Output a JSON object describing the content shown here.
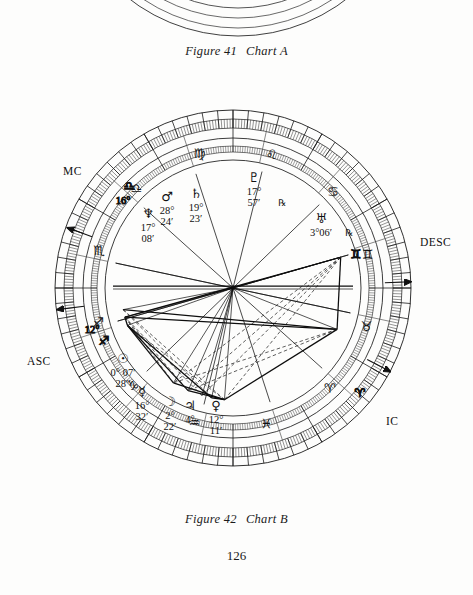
{
  "page": {
    "number": "126",
    "background_color": "#fdfdfc",
    "ink_color": "#111111"
  },
  "figures": [
    {
      "id": "chart-a",
      "figure_label": "Figure 41",
      "chart_label": "Chart A",
      "note": "only bottom arc of wheel visible at top of page"
    },
    {
      "id": "chart-b",
      "figure_label": "Figure 42",
      "chart_label": "Chart B"
    }
  ],
  "chart_data": {
    "type": "astrological-wheel",
    "title": "Chart B",
    "center": {
      "x": 233,
      "y": 288
    },
    "radii": {
      "outer_rim": 178,
      "degree_ring_inner": 160,
      "sign_band_outer": 150,
      "sign_band_inner": 128,
      "inner_wheel": 120
    },
    "ascendant_degrees": 192,
    "angles": [
      {
        "name": "MC",
        "label": "MC",
        "sign": "Libra",
        "sign_glyph": "♎",
        "degree": "16°"
      },
      {
        "name": "DESC",
        "label": "DESC",
        "sign": "Gemini",
        "sign_glyph": "♊",
        "degree": ""
      },
      {
        "name": "ASC",
        "label": "ASC",
        "sign": "Sagittarius",
        "sign_glyph": "♐",
        "degree": "12°"
      },
      {
        "name": "IC",
        "label": "IC",
        "sign": "Aries",
        "sign_glyph": "♈",
        "degree": ""
      }
    ],
    "signs": [
      {
        "name": "Virgo",
        "glyph": "♍",
        "angle_deg": 104
      },
      {
        "name": "Leo",
        "glyph": "♌",
        "angle_deg": 74
      },
      {
        "name": "Cancer",
        "glyph": "♋",
        "angle_deg": 44
      },
      {
        "name": "Gemini",
        "glyph": "♊",
        "angle_deg": 14
      },
      {
        "name": "Taurus",
        "glyph": "♉",
        "angle_deg": -16
      },
      {
        "name": "Aries",
        "glyph": "♈",
        "angle_deg": -46
      },
      {
        "name": "Pisces",
        "glyph": "♓",
        "angle_deg": -76
      },
      {
        "name": "Aquarius",
        "glyph": "♒",
        "angle_deg": -106
      },
      {
        "name": "Capricorn",
        "glyph": "♑",
        "angle_deg": -136
      },
      {
        "name": "Sagittarius",
        "glyph": "♐",
        "angle_deg": -166
      },
      {
        "name": "Scorpio",
        "glyph": "♏",
        "angle_deg": 164
      },
      {
        "name": "Libra",
        "glyph": "♎",
        "angle_deg": 134
      }
    ],
    "planets": [
      {
        "name": "Saturn",
        "glyph": "♄",
        "degree": "19°",
        "minute": "23′",
        "retrograde": false,
        "x": 196,
        "y": 198
      },
      {
        "name": "Mars",
        "glyph": "♂",
        "degree": "28°",
        "minute": "24′",
        "retrograde": false,
        "x": 167,
        "y": 201
      },
      {
        "name": "Neptune",
        "glyph": "♆",
        "degree": "17°",
        "minute": "08′",
        "retrograde": false,
        "x": 148,
        "y": 218
      },
      {
        "name": "Pluto",
        "glyph": "♇",
        "degree": "17°",
        "minute": "57′",
        "retrograde": true,
        "x": 254,
        "y": 182
      },
      {
        "name": "Uranus",
        "glyph": "♅",
        "degree": "3°06′",
        "minute": "",
        "retrograde": true,
        "x": 321,
        "y": 223
      },
      {
        "name": "Sun",
        "glyph": "☉",
        "degree": "0° 07′",
        "minute": "28″",
        "retrograde": false,
        "x": 123,
        "y": 363
      },
      {
        "name": "Mercury",
        "glyph": "☿",
        "degree": "16°",
        "minute": "32′",
        "retrograde": false,
        "x": 142,
        "y": 396
      },
      {
        "name": "Moon",
        "glyph": "☽",
        "degree": "2°",
        "minute": "22′",
        "retrograde": false,
        "x": 170,
        "y": 406
      },
      {
        "name": "Jupiter",
        "glyph": "♃",
        "degree": "4°",
        "minute": "",
        "retrograde": false,
        "x": 190,
        "y": 410
      },
      {
        "name": "Venus",
        "glyph": "♀",
        "degree": "12°",
        "minute": "11′",
        "retrograde": false,
        "x": 216,
        "y": 410
      }
    ],
    "retrograde_glyph": "℞",
    "aspect_lines": {
      "solid_count": 22,
      "dashed_count": 14,
      "description": "network of solid and dashed aspect lines converging at wheel center"
    }
  }
}
